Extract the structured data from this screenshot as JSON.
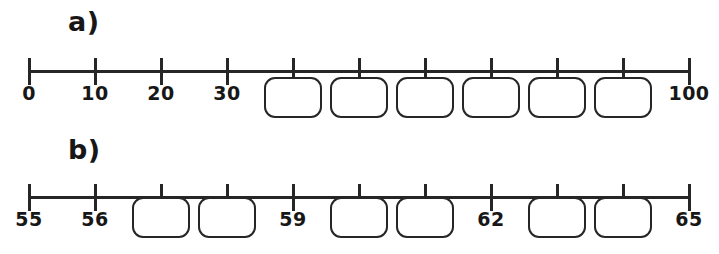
{
  "figure": {
    "type": "number-line-worksheet",
    "background_color": "#ffffff",
    "ink_color": "#262626"
  },
  "rows": [
    {
      "id": "a",
      "part_label": "a)",
      "axis": {
        "start_x": 29,
        "end_x": 689,
        "tick_count": 11,
        "tick_spacing": 66,
        "min": 0,
        "max": 100,
        "step": 10
      },
      "tick_labels": [
        {
          "index": 0,
          "text": "0"
        },
        {
          "index": 1,
          "text": "10"
        },
        {
          "index": 2,
          "text": "20"
        },
        {
          "index": 3,
          "text": "30"
        },
        {
          "index": 10,
          "text": "100"
        }
      ],
      "answer_boxes": [
        {
          "index": 4
        },
        {
          "index": 5
        },
        {
          "index": 6
        },
        {
          "index": 7
        },
        {
          "index": 8
        },
        {
          "index": 9
        }
      ]
    },
    {
      "id": "b",
      "part_label": "b)",
      "axis": {
        "start_x": 29,
        "end_x": 689,
        "tick_count": 11,
        "tick_spacing": 66,
        "min": 55,
        "max": 65,
        "step": 1
      },
      "tick_labels": [
        {
          "index": 0,
          "text": "55"
        },
        {
          "index": 1,
          "text": "56"
        },
        {
          "index": 4,
          "text": "59"
        },
        {
          "index": 7,
          "text": "62"
        },
        {
          "index": 10,
          "text": "65"
        }
      ],
      "answer_boxes": [
        {
          "index": 2
        },
        {
          "index": 3
        },
        {
          "index": 5
        },
        {
          "index": 6
        },
        {
          "index": 8
        },
        {
          "index": 9
        }
      ]
    }
  ]
}
